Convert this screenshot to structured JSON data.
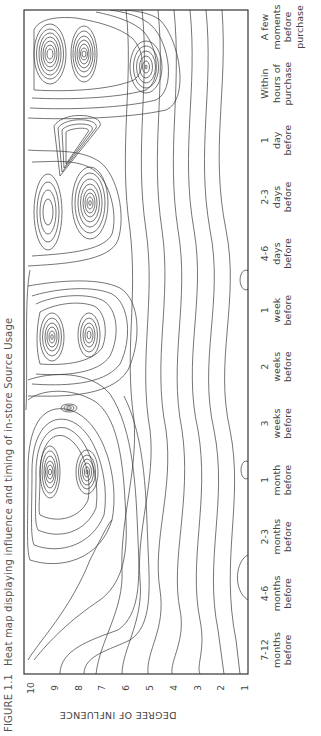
{
  "caption": {
    "figure_number": "FIGURE 1.1",
    "title": "Heat map displaying influence and timing of in-store Source Usage"
  },
  "chart_data": {
    "type": "heatmap",
    "style": "contour",
    "orientation": "rotated 90° counter-clockwise on page",
    "title": "Heat map displaying influence and timing of in-store Source Usage",
    "figure_label": "FIGURE 1.1",
    "xlabel": "",
    "ylabel": "DEGREE OF INFLUENCE",
    "y_ticks": [
      "10",
      "9",
      "8",
      "7",
      "6",
      "5",
      "4",
      "3",
      "2",
      "1"
    ],
    "ylim": [
      1,
      10
    ],
    "categories": [
      "7-12 months before",
      "4-6 months before",
      "2-3 months before",
      "1 month before",
      "3 weeks before",
      "2 weeks before",
      "1 week before",
      "4-6 days before",
      "2-3 days before",
      "1 day before",
      "Within hours of purchase",
      "A few moments before purchase"
    ],
    "category_lines": [
      [
        "7-12",
        "months",
        "before"
      ],
      [
        "4-6",
        "months",
        "before"
      ],
      [
        "2-3",
        "months",
        "before"
      ],
      [
        "1",
        "month",
        "before"
      ],
      [
        "3",
        "weeks",
        "before"
      ],
      [
        "2",
        "weeks",
        "before"
      ],
      [
        "1",
        "week",
        "before"
      ],
      [
        "4-6",
        "days",
        "before"
      ],
      [
        "2-3",
        "days",
        "before"
      ],
      [
        "1",
        "day",
        "before"
      ],
      [
        "Within",
        "hours of",
        "purchase"
      ],
      [
        "A few",
        "moments",
        "before",
        "purchase"
      ]
    ],
    "peaks": [
      {
        "time": "1 month before",
        "influence": 9.2,
        "intensity": "high"
      },
      {
        "time": "1 month before",
        "influence": 7.6,
        "intensity": "high"
      },
      {
        "time": "3 weeks before",
        "influence": 8.2,
        "intensity": "medium"
      },
      {
        "time": "1 week before",
        "influence": 9.2,
        "intensity": "high"
      },
      {
        "time": "1 week before",
        "influence": 7.6,
        "intensity": "high"
      },
      {
        "time": "2-3 days before",
        "influence": 9.0,
        "intensity": "medium"
      },
      {
        "time": "2-3 days before",
        "influence": 7.6,
        "intensity": "high"
      },
      {
        "time": "1 day before",
        "influence": 8.3,
        "intensity": "medium"
      },
      {
        "time": "A few moments before purchase",
        "influence": 9.2,
        "intensity": "very high"
      },
      {
        "time": "A few moments before purchase",
        "influence": 8.0,
        "intensity": "very high"
      },
      {
        "time": "A few moments before purchase",
        "influence": 5.8,
        "intensity": "medium"
      }
    ],
    "grid": false,
    "legend": "none"
  }
}
